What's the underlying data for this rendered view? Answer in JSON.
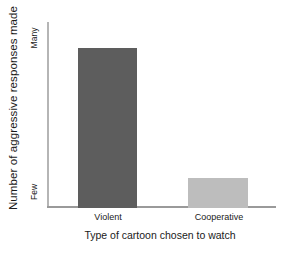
{
  "chart_data": {
    "type": "bar",
    "title": "",
    "subtitle": "",
    "xlabel": "Type of cartoon chosen to watch",
    "ylabel": "Number of aggressive responses made",
    "categories": [
      "Violent",
      "Cooperative"
    ],
    "values": [
      86,
      16
    ],
    "ylim": [
      0,
      100
    ],
    "ytick_labels": [
      "Few",
      "Many"
    ],
    "ytick_values": [
      0,
      100
    ],
    "y_axis_low_label": "Few",
    "y_axis_high_label": "Many",
    "grid": false,
    "legend": false,
    "legend_position": "none",
    "annotations": [],
    "series": [
      {
        "name": "Number of aggressive responses made",
        "values": [
          86,
          16
        ],
        "colors": [
          "#5d5d5d",
          "#bdbdbd"
        ]
      }
    ],
    "bar_colors": {
      "violent": "#5d5d5d",
      "cooperative": "#bdbdbd"
    },
    "axis_color": "#9a9a9a",
    "text_color": "#1a1a1a",
    "background": "#ffffff"
  }
}
